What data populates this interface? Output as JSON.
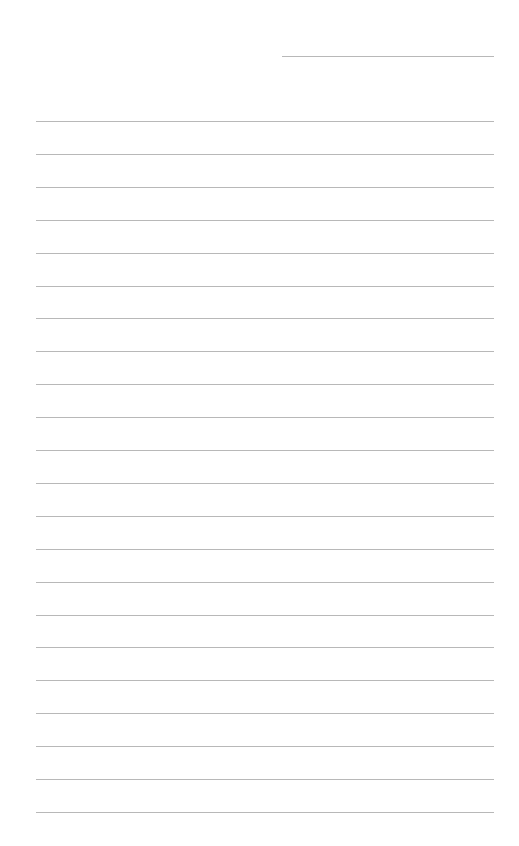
{
  "page": {
    "type": "lined-paper",
    "background": "#ffffff",
    "line_color": "#b8b8b8",
    "header_line": {
      "x": 282,
      "y": 56,
      "width": 212
    },
    "rules": {
      "x": 36,
      "width": 458,
      "first_y": 121,
      "spacing": 32.9,
      "count": 22
    }
  }
}
